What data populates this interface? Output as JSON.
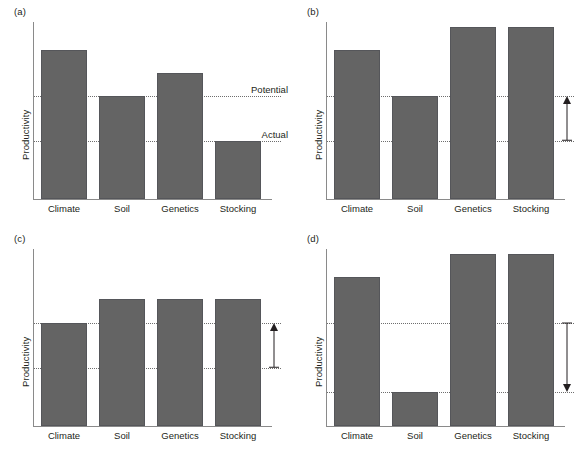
{
  "figure": {
    "background": "#ffffff",
    "bar_color": "#646464",
    "bar_edge_color": "#55565a",
    "axis_color": "#8a8a8a",
    "refline_color": "#6e6e6e",
    "text_color": "#231f20"
  },
  "axis": {
    "ylabel": "Productivity",
    "categories": [
      "Climate",
      "Soil",
      "Genetics",
      "Stocking"
    ]
  },
  "reference_lines": {
    "potential_label": "Potential",
    "actual_label": "Actual"
  },
  "panels": [
    {
      "id": "a",
      "label": "(a)",
      "show_refline_labels": true,
      "arrow": null
    },
    {
      "id": "b",
      "label": "(b)",
      "show_refline_labels": false,
      "arrow": "up"
    },
    {
      "id": "c",
      "label": "(c)",
      "show_refline_labels": false,
      "arrow": "up"
    },
    {
      "id": "d",
      "label": "(d)",
      "show_refline_labels": false,
      "arrow": "down"
    }
  ],
  "chart_data": [
    {
      "type": "bar",
      "title": "(a)",
      "xlabel": "",
      "ylabel": "Productivity",
      "categories": [
        "Climate",
        "Soil",
        "Genetics",
        "Stocking"
      ],
      "values": [
        0.84,
        0.58,
        0.71,
        0.33
      ],
      "ylim": [
        0,
        1
      ],
      "grid": false,
      "reference_lines": [
        {
          "name": "Potential",
          "value": 0.58,
          "label": "Potential",
          "style": "dotted"
        },
        {
          "name": "Actual",
          "value": 0.33,
          "label": "Actual",
          "style": "dotted"
        }
      ],
      "annotations": []
    },
    {
      "type": "bar",
      "title": "(b)",
      "xlabel": "",
      "ylabel": "Productivity",
      "categories": [
        "Climate",
        "Soil",
        "Genetics",
        "Stocking"
      ],
      "values": [
        0.84,
        0.58,
        0.97,
        0.97
      ],
      "ylim": [
        0,
        1
      ],
      "grid": false,
      "reference_lines": [
        {
          "name": "Potential",
          "value": 0.58,
          "label": "",
          "style": "dotted"
        },
        {
          "name": "Actual",
          "value": 0.33,
          "label": "",
          "style": "dotted"
        }
      ],
      "annotations": [
        {
          "type": "arrow",
          "direction": "up",
          "from": 0.33,
          "to": 0.58,
          "position": "right-margin"
        }
      ]
    },
    {
      "type": "bar",
      "title": "(c)",
      "xlabel": "",
      "ylabel": "Productivity",
      "categories": [
        "Climate",
        "Soil",
        "Genetics",
        "Stocking"
      ],
      "values": [
        0.58,
        0.72,
        0.72,
        0.72
      ],
      "ylim": [
        0,
        1
      ],
      "grid": false,
      "reference_lines": [
        {
          "name": "Potential",
          "value": 0.58,
          "label": "",
          "style": "dotted"
        },
        {
          "name": "Actual",
          "value": 0.33,
          "label": "",
          "style": "dotted"
        }
      ],
      "annotations": [
        {
          "type": "arrow",
          "direction": "up",
          "from": 0.33,
          "to": 0.58,
          "position": "right-margin"
        }
      ]
    },
    {
      "type": "bar",
      "title": "(d)",
      "xlabel": "",
      "ylabel": "Productivity",
      "categories": [
        "Climate",
        "Soil",
        "Genetics",
        "Stocking"
      ],
      "values": [
        0.84,
        0.19,
        0.97,
        0.97
      ],
      "ylim": [
        0,
        1
      ],
      "grid": false,
      "reference_lines": [
        {
          "name": "Potential",
          "value": 0.58,
          "label": "",
          "style": "dotted"
        },
        {
          "name": "Actual",
          "value": 0.19,
          "label": "",
          "style": "dotted"
        }
      ],
      "annotations": [
        {
          "type": "arrow",
          "direction": "down",
          "from": 0.58,
          "to": 0.19,
          "position": "right-margin"
        }
      ]
    }
  ]
}
